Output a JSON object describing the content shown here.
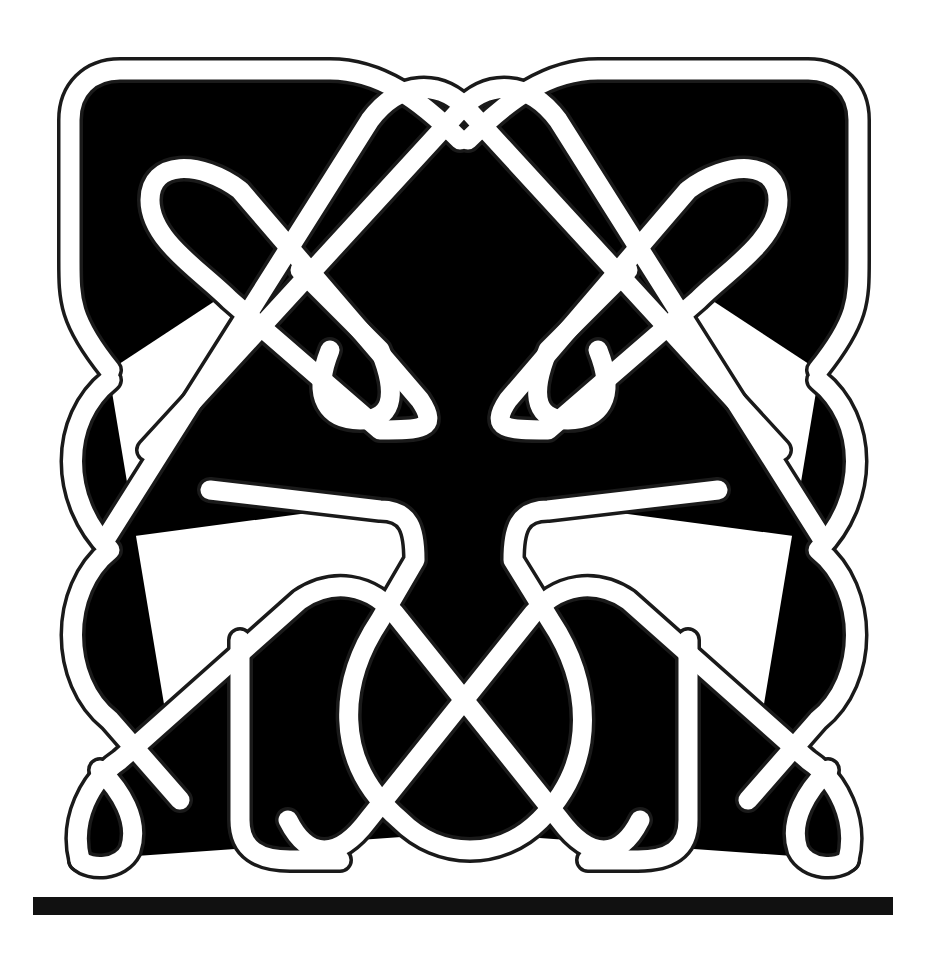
{
  "image": {
    "subject": "Celtic knot line drawing",
    "stroke_color": "#1a1a1a",
    "background": "#ffffff",
    "baseline_bar_color": "#111111"
  }
}
